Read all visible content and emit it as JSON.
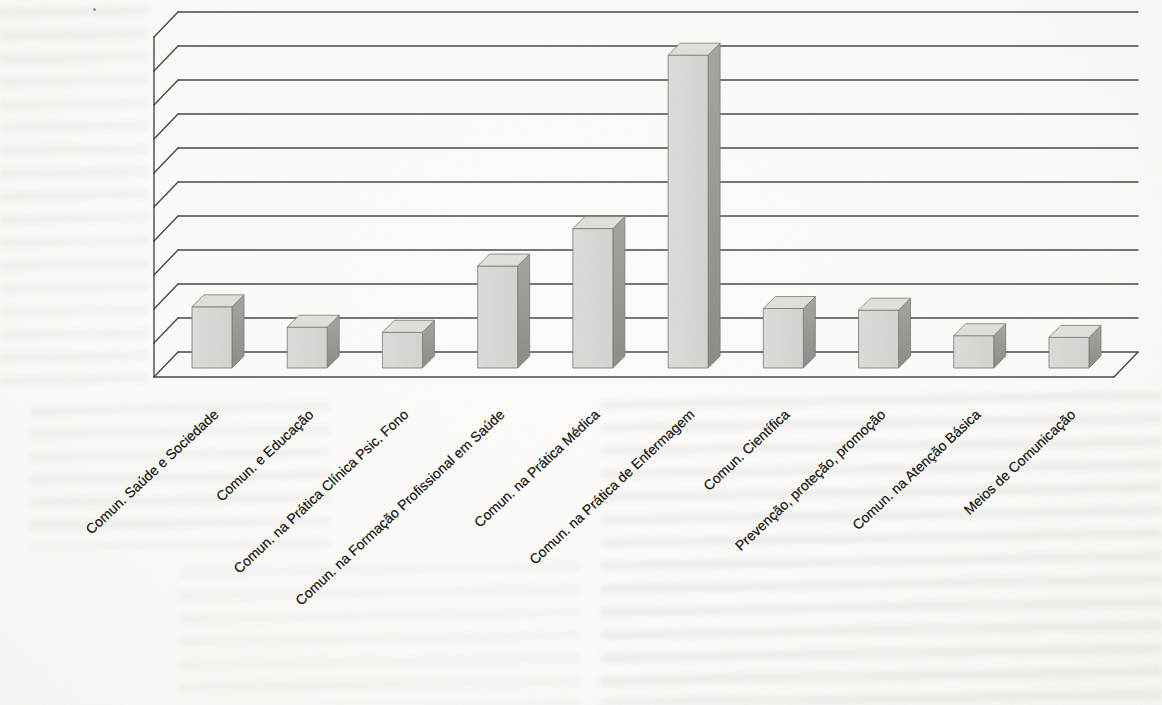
{
  "chart_data": {
    "type": "bar",
    "variant": "3d-column",
    "title": "",
    "xlabel": "",
    "ylabel": "",
    "categories": [
      "Comun. Saúde e Sociedade",
      "Comun. e Educação",
      "Comun. na Prática Clínica Psic. Fono",
      "Comun. na Formação Profissional em Saúde",
      "Comun. na Prática Médica",
      "Comun. na Prática de Enfermagem",
      "Comun. Científica",
      "Prevenção, proteção, promoção",
      "Comun. na Atenção Básica",
      "Meios de Comunicação"
    ],
    "values": [
      1.8,
      1.2,
      1.05,
      3.0,
      4.1,
      9.2,
      1.75,
      1.7,
      0.95,
      0.9
    ],
    "value_unit": "gridline units (y-axis has no visible numeric labels)",
    "ylim": [
      0,
      10
    ],
    "gridline_count": 10,
    "grid": true,
    "legend": false,
    "colors": {
      "bar_front": "#d4d3cf",
      "bar_front_light": "#dcdbd7",
      "bar_top": "#e0dfda",
      "bar_side": "#a6a4a0",
      "bar_side_dark": "#8e8c88",
      "bar_edge": "#7a7874",
      "grid_line": "#3a3834",
      "paper": "#fbfaf7",
      "label_text": "#1f1e1c"
    }
  },
  "scan_artifacts": {
    "bleed_through_text_visible": true,
    "speck_positions": [
      [
        94,
        9
      ]
    ]
  }
}
